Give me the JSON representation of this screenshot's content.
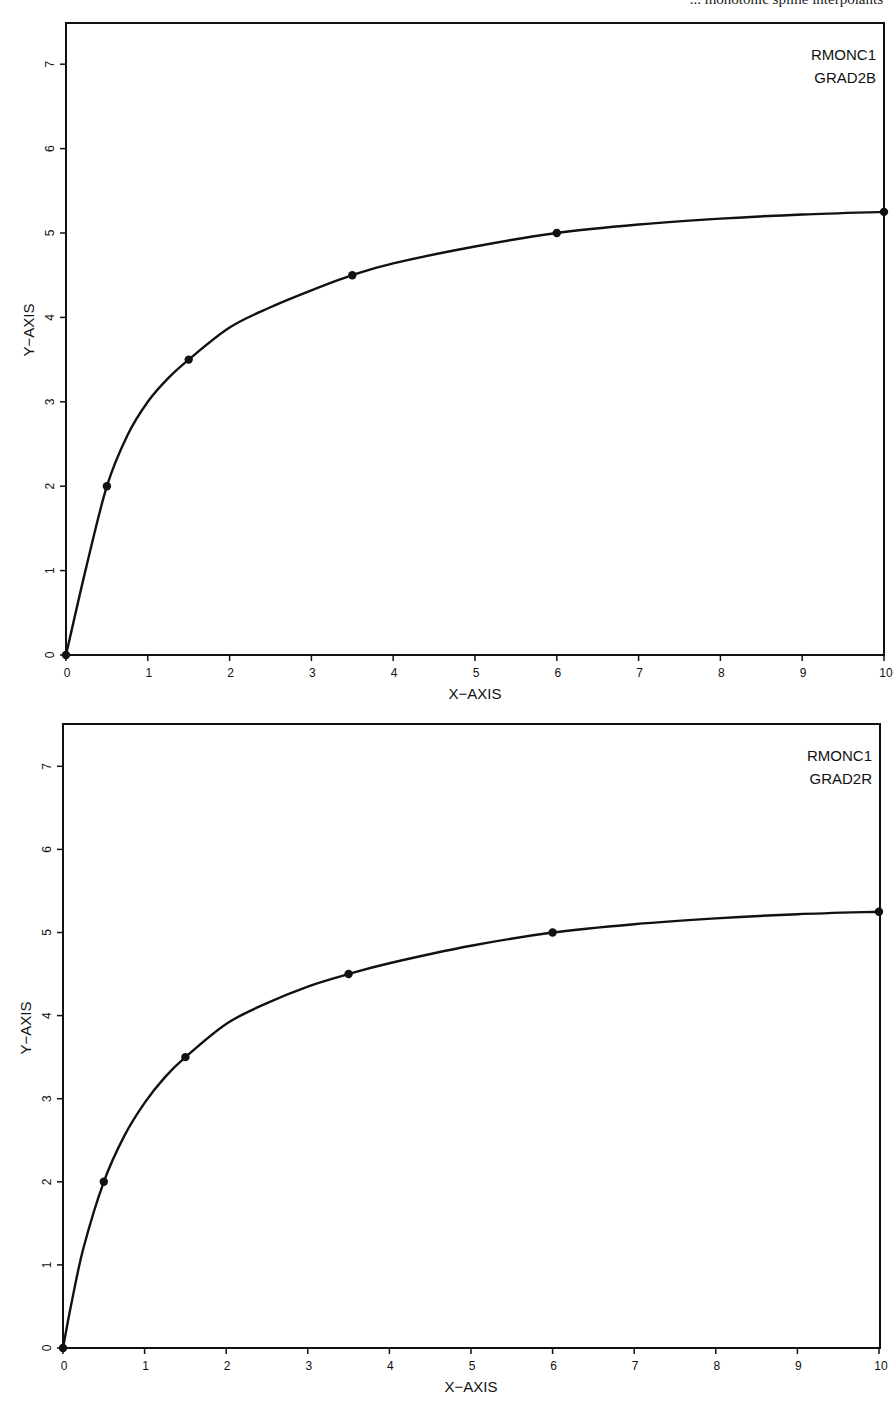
{
  "page": {
    "header_fragment": "... monotonic spline interpolants"
  },
  "chart_data": [
    {
      "type": "line",
      "title": "",
      "labels": [
        "RMONC1",
        "GRAD2B"
      ],
      "xlabel": "X-AXIS",
      "ylabel": "Y-AXIS",
      "xlim": [
        0,
        10
      ],
      "ylim": [
        0,
        7.5
      ],
      "xticks": [
        "0",
        "1",
        "2",
        "3",
        "4",
        "5",
        "6",
        "7",
        "8",
        "9",
        "10"
      ],
      "yticks": [
        "0",
        "1",
        "2",
        "3",
        "4",
        "5",
        "6",
        "7"
      ],
      "grid": false,
      "points": {
        "x": [
          0,
          0.5,
          1.5,
          3.5,
          6,
          10
        ],
        "y": [
          0,
          2,
          3.5,
          4.5,
          5,
          5.25
        ]
      },
      "curve": {
        "x": [
          0,
          0.25,
          0.5,
          0.75,
          1,
          1.25,
          1.5,
          2,
          2.5,
          3,
          3.5,
          4,
          5,
          6,
          7,
          8,
          9,
          10
        ],
        "y": [
          0,
          1.05,
          2,
          2.6,
          3.0,
          3.28,
          3.5,
          3.88,
          4.12,
          4.32,
          4.5,
          4.64,
          4.84,
          5.0,
          5.1,
          5.17,
          5.22,
          5.25
        ]
      }
    },
    {
      "type": "line",
      "title": "",
      "labels": [
        "RMONC1",
        "GRAD2R"
      ],
      "xlabel": "X-AXIS",
      "ylabel": "Y-AXIS",
      "xlim": [
        0,
        10
      ],
      "ylim": [
        0,
        7.5
      ],
      "xticks": [
        "0",
        "1",
        "2",
        "3",
        "4",
        "5",
        "6",
        "7",
        "8",
        "9",
        "10"
      ],
      "yticks": [
        "0",
        "1",
        "2",
        "3",
        "4",
        "5",
        "6",
        "7"
      ],
      "grid": false,
      "points": {
        "x": [
          0,
          0.5,
          1.5,
          3.5,
          6,
          10
        ],
        "y": [
          0,
          2,
          3.5,
          4.5,
          5,
          5.25
        ]
      },
      "curve": {
        "x": [
          0,
          0.1,
          0.25,
          0.5,
          0.75,
          1,
          1.25,
          1.5,
          2,
          2.5,
          3,
          3.5,
          4,
          5,
          6,
          7,
          8,
          9,
          10
        ],
        "y": [
          0,
          0.52,
          1.2,
          2,
          2.55,
          2.95,
          3.26,
          3.5,
          3.9,
          4.15,
          4.35,
          4.5,
          4.63,
          4.84,
          5.0,
          5.1,
          5.17,
          5.22,
          5.25
        ]
      }
    }
  ]
}
